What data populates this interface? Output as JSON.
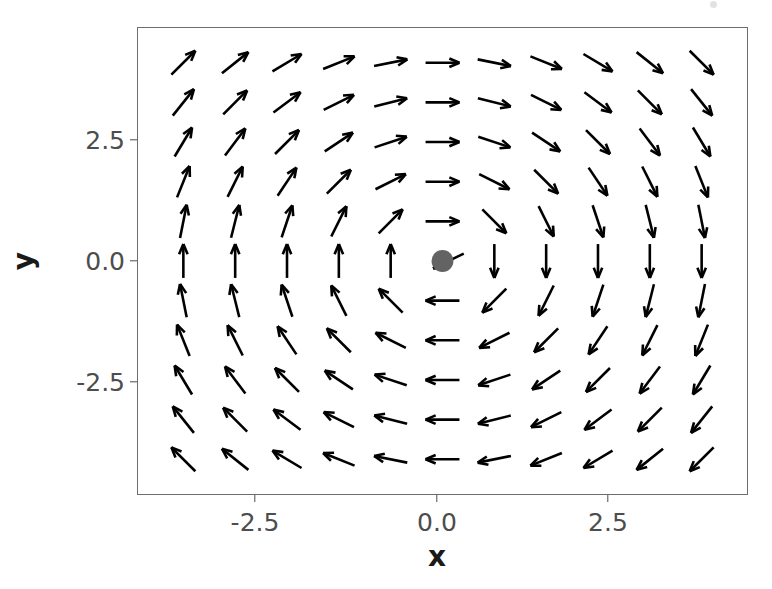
{
  "figure": {
    "width": 772,
    "height": 589,
    "background": "#ffffff",
    "panel": {
      "left": 137,
      "top": 27,
      "width": 611,
      "height": 468,
      "border_color": "#6d6d6d",
      "fill": "#ffffff"
    }
  },
  "axes": {
    "x_label": "x",
    "y_label": "y",
    "x_ticks": [
      "-2.5",
      "0.0",
      "2.5"
    ],
    "y_ticks": [
      "2.5",
      "0.0",
      "-2.5"
    ],
    "x_tick_values": [
      -2.5,
      0.0,
      2.5
    ],
    "y_tick_values": [
      2.5,
      0.0,
      -2.5
    ],
    "tick_color": "#4d4d4d",
    "label_color": "#1a1a1a"
  },
  "chart_data": {
    "type": "scatter",
    "subtype": "vector-field-quiver",
    "title": "",
    "subtitle": "",
    "xlabel": "x",
    "ylabel": "y",
    "xlim": [
      -4.7,
      4.7
    ],
    "ylim": [
      -4.7,
      4.7
    ],
    "xticks": [
      -2.5,
      0.0,
      2.5
    ],
    "yticks": [
      -2.5,
      0.0,
      2.5
    ],
    "grid": false,
    "legend": null,
    "legend_position": "none",
    "arrow_color": "#000000",
    "arrow_line_width": 2.6,
    "arrow_head_length": 11,
    "arrow_scale": 17,
    "field": {
      "u_expression": "y",
      "v_expression": "-x",
      "description": "clockwise rotational vector field about the origin",
      "normalized": true
    },
    "grid_x": [
      -4.0,
      -3.2,
      -2.4,
      -1.6,
      -0.8,
      0.0,
      0.8,
      1.6,
      2.4,
      3.2,
      4.0
    ],
    "grid_y": [
      4.0,
      3.2,
      2.4,
      1.6,
      0.8,
      0.0,
      -0.8,
      -1.6,
      -2.4,
      -3.2,
      -4.0
    ],
    "n_rows": 11,
    "n_cols": 11,
    "fixed_point": {
      "x": 0.0,
      "y": 0.0,
      "marker": "circle",
      "color": "#636363",
      "radius_px": 11,
      "label": "equilibrium-point"
    },
    "annotations": []
  }
}
